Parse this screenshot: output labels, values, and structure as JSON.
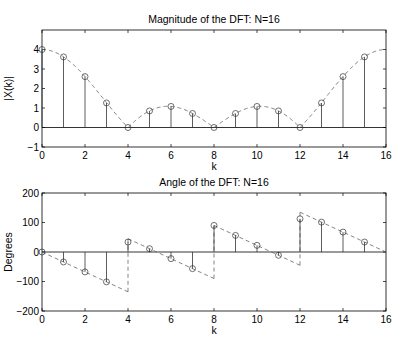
{
  "chart_data": [
    {
      "type": "stem",
      "title": "Magnitude of the DFT: N=16",
      "xlabel": "k",
      "ylabel": "|X(k)|",
      "xlim": [
        0,
        16
      ],
      "ylim": [
        -1,
        5
      ],
      "xticks": [
        0,
        2,
        4,
        6,
        8,
        10,
        12,
        14,
        16
      ],
      "yticks": [
        -1,
        0,
        1,
        2,
        3,
        4
      ],
      "grid": false,
      "series": [
        {
          "name": "DFT magnitude",
          "style": "stem-circle",
          "x": [
            0,
            1,
            2,
            3,
            4,
            5,
            6,
            7,
            8,
            9,
            10,
            11,
            12,
            13,
            14,
            15
          ],
          "values": [
            4,
            3.62,
            2.61,
            1.26,
            0,
            0.85,
            1.08,
            0.72,
            0,
            0.72,
            1.08,
            0.85,
            0,
            1.26,
            2.61,
            3.62
          ]
        },
        {
          "name": "DTFT magnitude",
          "style": "dashed-line",
          "function": "abs(sin(pi*k/4)/sin(pi*k/16))",
          "x_range": [
            0,
            16
          ]
        }
      ]
    },
    {
      "type": "stem",
      "title": "Angle of the DFT: N=16",
      "xlabel": "k",
      "ylabel": "Degrees",
      "xlim": [
        0,
        16
      ],
      "ylim": [
        -200,
        200
      ],
      "xticks": [
        0,
        2,
        4,
        6,
        8,
        10,
        12,
        14,
        16
      ],
      "yticks": [
        -200,
        -100,
        0,
        100,
        200
      ],
      "grid": false,
      "series": [
        {
          "name": "DFT phase",
          "style": "stem-circle",
          "x": [
            0,
            1,
            2,
            3,
            4,
            5,
            6,
            7,
            8,
            9,
            10,
            11,
            12,
            13,
            14,
            15
          ],
          "values": [
            0,
            -33.75,
            -67.5,
            -101.25,
            33.75,
            11.25,
            -22.5,
            -56.25,
            90,
            56.25,
            22.5,
            -11.25,
            112.5,
            101.25,
            67.5,
            33.75
          ]
        },
        {
          "name": "DTFT phase",
          "style": "dashed-line",
          "segments": [
            {
              "x": [
                0,
                4
              ],
              "y": [
                0,
                -135
              ]
            },
            {
              "x": [
                4,
                8
              ],
              "y": [
                45,
                -90
              ]
            },
            {
              "x": [
                8,
                12
              ],
              "y": [
                90,
                -45
              ]
            },
            {
              "x": [
                12,
                16
              ],
              "y": [
                135,
                0
              ]
            }
          ]
        }
      ]
    }
  ]
}
